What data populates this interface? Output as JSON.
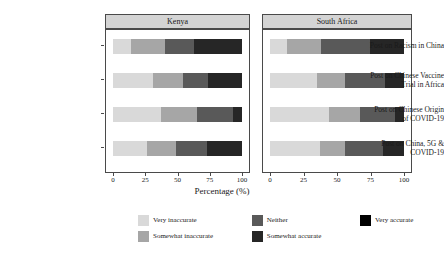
{
  "chart_data": {
    "type": "bar",
    "subtype": "stacked-horizontal-100pct",
    "title": "",
    "xlabel": "Percentage (%)",
    "ylabel": "",
    "xlim": [
      0,
      100
    ],
    "xticks": [
      0,
      25,
      50,
      75,
      100
    ],
    "grid": false,
    "legend_position": "bottom",
    "facets": [
      "Kenya",
      "South Africa"
    ],
    "categories": [
      "Post on Racism in China",
      "Post on Chinese Vaccine Trial in Africa",
      "Post on Chinese Origin of COVID-19",
      "Post on China, 5G & COVID-19"
    ],
    "series": [
      {
        "name": "Very inaccurate",
        "color": "#d9d9d9"
      },
      {
        "name": "Somewhat inaccurate",
        "color": "#a6a6a6"
      },
      {
        "name": "Neither",
        "color": "#595959"
      },
      {
        "name": "Somewhat accurate",
        "color": "#262626"
      },
      {
        "name": "Very accurate",
        "color": "#000000"
      }
    ],
    "panels": [
      {
        "facet": "Kenya",
        "rows": [
          {
            "category": "Post on Racism in China",
            "values": [
              14,
              26,
              23,
              37,
              0
            ]
          },
          {
            "category": "Post on Chinese Vaccine Trial in Africa",
            "values": [
              31,
              23,
              20,
              26,
              0
            ]
          },
          {
            "category": "Post on Chinese Origin of COVID-19",
            "values": [
              37,
              28,
              28,
              7,
              0
            ]
          },
          {
            "category": "Post on China, 5G & COVID-19",
            "values": [
              26,
              23,
              24,
              27,
              0
            ]
          }
        ]
      },
      {
        "facet": "South Africa",
        "rows": [
          {
            "category": "Post on Racism in China",
            "values": [
              13,
              25,
              37,
              25,
              0
            ]
          },
          {
            "category": "Post on Chinese Vaccine Trial in Africa",
            "values": [
              35,
              21,
              30,
              14,
              0
            ]
          },
          {
            "category": "Post on Chinese Origin of COVID-19",
            "values": [
              44,
              23,
              26,
              7,
              0
            ]
          },
          {
            "category": "Post on China, 5G & COVID-19",
            "values": [
              37,
              19,
              28,
              16,
              0
            ]
          }
        ]
      }
    ]
  },
  "strips": {
    "left": "Kenya",
    "right": "South Africa"
  },
  "ylabels": [
    "Post on Racism in China",
    "Post on Chinese Vaccine\nTrial in Africa",
    "Post on Chinese Origin\nof COVID-19",
    "Post on China, 5G &\nCOVID-19"
  ],
  "xaxis": {
    "title": "Percentage (%)",
    "ticks": [
      "0",
      "25",
      "50",
      "75",
      "100"
    ]
  },
  "legend": {
    "items": [
      {
        "label": "Very inaccurate",
        "color": "#d9d9d9"
      },
      {
        "label": "Neither",
        "color": "#595959"
      },
      {
        "label": "Very accurate",
        "color": "#000000"
      },
      {
        "label": "Somewhat inaccurate",
        "color": "#a6a6a6"
      },
      {
        "label": "Somewhat accurate",
        "color": "#262626"
      }
    ]
  }
}
